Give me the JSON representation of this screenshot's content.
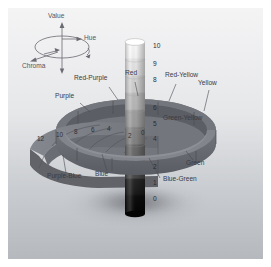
{
  "figure": {
    "background_top": "#f2f2f2",
    "background_bottom": "#b9bcc0",
    "ink": "#3b3b42"
  },
  "legend": {
    "value_label": "Value",
    "hue_label": "Hue",
    "chroma_label": "Chroma",
    "icons": {
      "value_axis": "vertical-arrow-icon",
      "hue_orbit": "circular-arrow-icon",
      "chroma_radius": "radial-arrow-icon"
    }
  },
  "value_axis": {
    "name": "value",
    "min": 0,
    "max": 10,
    "ticks": [
      "10",
      "9",
      "8",
      "6",
      "5",
      "4",
      "2",
      "1",
      "0"
    ],
    "top_color": "#ffffff",
    "bottom_color": "#000000",
    "steps": [
      {
        "value": "10",
        "color": "#fdfdfd"
      },
      {
        "value": "9",
        "color": "#ededed"
      },
      {
        "value": "8",
        "color": "#dcdcdc"
      },
      {
        "value": "7",
        "color": "#c6c6c6"
      },
      {
        "value": "6",
        "color": "#ababab"
      },
      {
        "value": "5",
        "color": "#8e8e8e"
      },
      {
        "value": "4",
        "color": "#6f6f6f"
      },
      {
        "value": "3",
        "color": "#4f4f4f"
      },
      {
        "value": "2",
        "color": "#2b2b2b"
      },
      {
        "value": "1",
        "color": "#141414"
      },
      {
        "value": "0",
        "color": "#050505"
      }
    ]
  },
  "chroma_axis": {
    "name": "chroma",
    "ticks": [
      "12",
      "10",
      "8",
      "6",
      "4",
      "2",
      "0"
    ],
    "slab_color": "#7d7f86"
  },
  "hue_ring": {
    "name": "hue",
    "band_color": "#6e7077",
    "band_color_light": "#8c8f96",
    "labels": [
      "Red-Purple",
      "Red",
      "Red-Yellow",
      "Yellow",
      "Green-Yellow",
      "Green",
      "Blue-Green",
      "Blue",
      "Purple-Blue",
      "Purple"
    ]
  }
}
